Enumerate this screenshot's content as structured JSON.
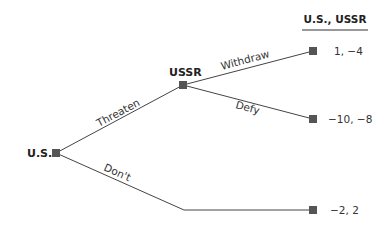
{
  "header": {
    "payoff_title": "U.S., USSR"
  },
  "players": {
    "us": "U.S.",
    "ussr": "USSR"
  },
  "edges": {
    "threaten": "Threaten",
    "dont": "Don't",
    "withdraw": "Withdraw",
    "defy": "Defy"
  },
  "payoffs": {
    "withdraw": "1, −4",
    "defy": "−10, −8",
    "dont": "−2, 2"
  },
  "colors": {
    "node": "#555555",
    "line": "#444444",
    "text": "#222222"
  }
}
